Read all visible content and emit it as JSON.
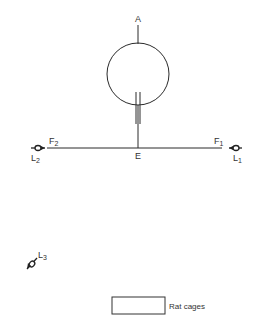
{
  "diagram": {
    "top_label": "A",
    "junction_label": "E",
    "left_field": {
      "main": "F",
      "sub": "2"
    },
    "right_field": {
      "main": "F",
      "sub": "1"
    },
    "left_light": {
      "main": "L",
      "sub": "2"
    },
    "right_light": {
      "main": "L",
      "sub": "1"
    },
    "third_light": {
      "main": "L",
      "sub": "3"
    },
    "legend": {
      "label": "Rat cages"
    }
  }
}
